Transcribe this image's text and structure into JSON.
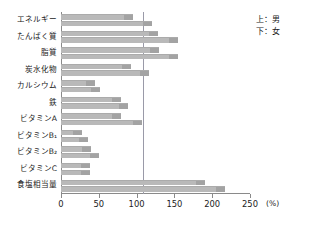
{
  "legend": {
    "top_line": "上：男",
    "bottom_line": "下：女",
    "series_top_name": "男",
    "series_bottom_name": "女"
  },
  "axis": {
    "unit": "(%)",
    "ticks": [
      0,
      50,
      100,
      150,
      200,
      250
    ],
    "tick_labels": [
      "0",
      "50",
      "100",
      "150",
      "200",
      "250"
    ],
    "reference_line_value": 100
  },
  "colors": {
    "bar": "#b9b9b9",
    "bar_cap": "#a3a3a3",
    "axis": "#8a8a8a",
    "reference_line": "#9a9aa8",
    "text": "#1a1a1a",
    "background": "#ffffff"
  },
  "chart_data": {
    "type": "bar",
    "orientation": "horizontal",
    "title": "",
    "subtitle": "",
    "xlabel": "(%)",
    "ylabel": "",
    "xlim": [
      0,
      250
    ],
    "grid": false,
    "legend_position": "top-right",
    "annotations": [
      "上：男",
      "下：女",
      "100% 基準線"
    ],
    "categories": [
      "エネルギー",
      "たんぱく質",
      "脂質",
      "炭水化物",
      "カルシウム",
      "鉄",
      "ビタミンA",
      "ビタミンB₁",
      "ビタミンB₂",
      "ビタミンC",
      "食塩相当量"
    ],
    "series": [
      {
        "name": "男",
        "position": "上",
        "values": [
          95,
          128,
          130,
          92,
          45,
          80,
          80,
          28,
          40,
          38,
          190
        ]
      },
      {
        "name": "女",
        "position": "下",
        "values": [
          120,
          155,
          155,
          117,
          52,
          88,
          107,
          36,
          50,
          38,
          217
        ]
      }
    ]
  }
}
